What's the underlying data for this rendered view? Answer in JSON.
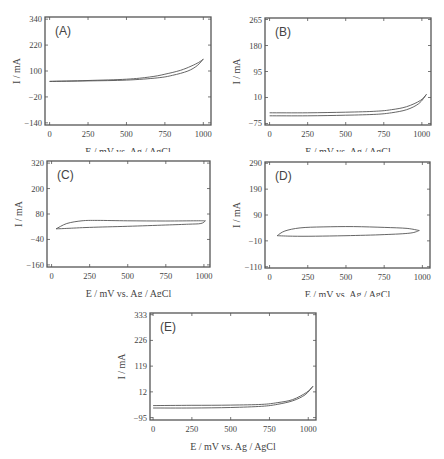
{
  "chart_data": [
    {
      "type": "line",
      "panel_label": "(A)",
      "xlabel": "E / mV vs. Ag / AgCl",
      "ylabel": "I / mA",
      "xlim": [
        -30,
        1050
      ],
      "ylim": [
        -150,
        350
      ],
      "x_ticks": [
        0,
        250,
        500,
        750,
        1000
      ],
      "y_ticks": [
        -140,
        -20,
        100,
        220,
        340
      ],
      "grid": false,
      "series": [
        {
          "name": "forward",
          "x": [
            0,
            250,
            500,
            650,
            750,
            850,
            920,
            970,
            1000
          ],
          "y": [
            52,
            56,
            62,
            72,
            85,
            103,
            122,
            140,
            155
          ]
        },
        {
          "name": "reverse",
          "x": [
            1000,
            960,
            900,
            800,
            700,
            500,
            250,
            0
          ],
          "y": [
            155,
            125,
            100,
            80,
            68,
            58,
            54,
            52
          ]
        }
      ]
    },
    {
      "type": "line",
      "panel_label": "(B)",
      "xlabel": "E / mV vs. Ag / AgCl",
      "ylabel": "I / mA",
      "xlim": [
        -30,
        1060
      ],
      "ylim": [
        -80,
        270
      ],
      "x_ticks": [
        0,
        250,
        500,
        750,
        1000
      ],
      "y_ticks": [
        -75,
        10,
        95,
        180,
        265
      ],
      "grid": false,
      "series": [
        {
          "name": "forward",
          "x": [
            0,
            250,
            500,
            700,
            800,
            900,
            980,
            1030
          ],
          "y": [
            -50,
            -50,
            -48,
            -45,
            -40,
            -30,
            -10,
            20
          ]
        },
        {
          "name": "reverse",
          "x": [
            1030,
            990,
            900,
            800,
            700,
            500,
            250,
            0
          ],
          "y": [
            20,
            0,
            -20,
            -30,
            -35,
            -38,
            -40,
            -40
          ]
        }
      ]
    },
    {
      "type": "line",
      "panel_label": "(C)",
      "xlabel": "E / mV vs. Ag / AgCl",
      "ylabel": "I / mA",
      "xlim": [
        -30,
        1040
      ],
      "ylim": [
        -170,
        330
      ],
      "x_ticks": [
        0,
        250,
        500,
        750,
        1000
      ],
      "y_ticks": [
        -160,
        -40,
        80,
        200,
        320
      ],
      "grid": false,
      "series": [
        {
          "name": "anodic",
          "x": [
            30,
            100,
            200,
            300,
            500,
            750,
            950,
            1010
          ],
          "y": [
            10,
            35,
            48,
            50,
            48,
            47,
            48,
            48
          ]
        },
        {
          "name": "cathodic",
          "x": [
            1010,
            980,
            900,
            750,
            500,
            250,
            100,
            30
          ],
          "y": [
            48,
            35,
            32,
            28,
            22,
            17,
            12,
            10
          ]
        }
      ]
    },
    {
      "type": "line",
      "panel_label": "(D)",
      "xlabel": "E / mV vs. Ag / AgCl",
      "ylabel": "I / mA",
      "xlim": [
        -30,
        1050
      ],
      "ylim": [
        -115,
        295
      ],
      "x_ticks": [
        0,
        250,
        500,
        750,
        1000
      ],
      "y_ticks": [
        -110,
        -10,
        90,
        190,
        290
      ],
      "grid": false,
      "series": [
        {
          "name": "anodic",
          "x": [
            50,
            100,
            200,
            350,
            550,
            750,
            900,
            980
          ],
          "y": [
            10,
            28,
            40,
            44,
            45,
            42,
            38,
            30
          ]
        },
        {
          "name": "cathodic",
          "x": [
            980,
            920,
            750,
            500,
            300,
            150,
            50
          ],
          "y": [
            30,
            20,
            14,
            10,
            8,
            8,
            10
          ]
        }
      ]
    },
    {
      "type": "line",
      "panel_label": "(E)",
      "xlabel": "E / mV vs. Ag / AgCl",
      "ylabel": "I / mA",
      "xlim": [
        -20,
        1050
      ],
      "ylim": [
        -105,
        340
      ],
      "x_ticks": [
        0,
        250,
        500,
        750,
        1000
      ],
      "y_ticks": [
        -95,
        12,
        119,
        226,
        333
      ],
      "grid": false,
      "series": [
        {
          "name": "forward",
          "x": [
            0,
            250,
            500,
            700,
            800,
            900,
            980,
            1030
          ],
          "y": [
            -55,
            -55,
            -53,
            -48,
            -40,
            -25,
            0,
            35
          ]
        },
        {
          "name": "reverse",
          "x": [
            1030,
            990,
            900,
            800,
            700,
            500,
            250,
            0
          ],
          "y": [
            35,
            10,
            -20,
            -33,
            -40,
            -43,
            -44,
            -45
          ]
        }
      ]
    }
  ],
  "panels": [
    {
      "label": "(A)",
      "ylabel": "I / mA",
      "xlabel": "E / mV vs. Ag / AgCl",
      "x_ticks": [
        "0",
        "250",
        "500",
        "750",
        "1000"
      ],
      "y_ticks": [
        "−140",
        "−20",
        "100",
        "220",
        "340"
      ]
    },
    {
      "label": "(B)",
      "ylabel": "I / mA",
      "xlabel": "E / mV vs. Ag / AgCl",
      "x_ticks": [
        "0",
        "250",
        "500",
        "750",
        "1000"
      ],
      "y_ticks": [
        "−75",
        "10",
        "95",
        "180",
        "265"
      ]
    },
    {
      "label": "(C)",
      "ylabel": "I / mA",
      "xlabel": "E / mV vs. Ag / AgCl",
      "x_ticks": [
        "0",
        "250",
        "500",
        "750",
        "1000"
      ],
      "y_ticks": [
        "−160",
        "−40",
        "80",
        "200",
        "320"
      ]
    },
    {
      "label": "(D)",
      "ylabel": "I / mA",
      "xlabel": "E / mV vs. Ag / AgCl",
      "x_ticks": [
        "0",
        "250",
        "500",
        "750",
        "1000"
      ],
      "y_ticks": [
        "−110",
        "−10",
        "90",
        "190",
        "290"
      ]
    },
    {
      "label": "(E)",
      "ylabel": "I / mA",
      "xlabel": "E / mV vs. Ag / AgCl",
      "x_ticks": [
        "0",
        "250",
        "500",
        "750",
        "1000"
      ],
      "y_ticks": [
        "−95",
        "12",
        "119",
        "226",
        "333"
      ]
    }
  ]
}
